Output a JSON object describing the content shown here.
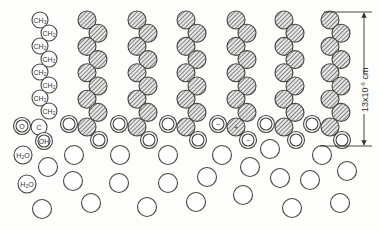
{
  "diagram": {
    "type": "monolayer-molecular-schematic",
    "stroke_color": "#444444",
    "hatch_color": "#555555",
    "background": "#fdfdfb",
    "labeled_molecule": {
      "chain_atoms": [
        {
          "label": "CH3",
          "x": 40,
          "y": 20
        },
        {
          "label": "CH2",
          "x": 49,
          "y": 33
        },
        {
          "label": "CH2",
          "x": 40,
          "y": 46
        },
        {
          "label": "CH2",
          "x": 49,
          "y": 59
        },
        {
          "label": "CH2",
          "x": 40,
          "y": 72
        },
        {
          "label": "CH2",
          "x": 49,
          "y": 85
        },
        {
          "label": "CH2",
          "x": 40,
          "y": 98
        },
        {
          "label": "CH2",
          "x": 49,
          "y": 111
        }
      ],
      "head_atoms": [
        {
          "label": "O",
          "x": 22,
          "y": 126,
          "double": true
        },
        {
          "label": "C",
          "x": 39,
          "y": 127,
          "double": false
        },
        {
          "label": "OH",
          "x": 44,
          "y": 141,
          "double": true
        }
      ]
    },
    "hatched_chains": [
      {
        "x": 87,
        "ionized": false
      },
      {
        "x": 137,
        "ionized": false
      },
      {
        "x": 186,
        "ionized": false
      },
      {
        "x": 236,
        "ionized": true
      },
      {
        "x": 284,
        "ionized": false
      },
      {
        "x": 330,
        "ionized": false
      }
    ],
    "ion_labels": {
      "positive": "+",
      "negative": "−"
    },
    "water_labels": [
      {
        "label": "H2O",
        "x": 23,
        "y": 155
      },
      {
        "label": "H2O",
        "x": 27,
        "y": 184
      }
    ],
    "water_molecules": [
      [
        48,
        167
      ],
      [
        74,
        155
      ],
      [
        73,
        181
      ],
      [
        42,
        209
      ],
      [
        91,
        203
      ],
      [
        120,
        155
      ],
      [
        119,
        183
      ],
      [
        147,
        207
      ],
      [
        168,
        155
      ],
      [
        168,
        183
      ],
      [
        196,
        202
      ],
      [
        207,
        177
      ],
      [
        222,
        155
      ],
      [
        243,
        195
      ],
      [
        250,
        167
      ],
      [
        270,
        149
      ],
      [
        280,
        178
      ],
      [
        292,
        208
      ],
      [
        310,
        180
      ],
      [
        322,
        155
      ],
      [
        340,
        203
      ],
      [
        347,
        171
      ]
    ],
    "dimension": {
      "label_main": "13x10",
      "label_exp": "-6",
      "label_unit": " cm"
    }
  }
}
